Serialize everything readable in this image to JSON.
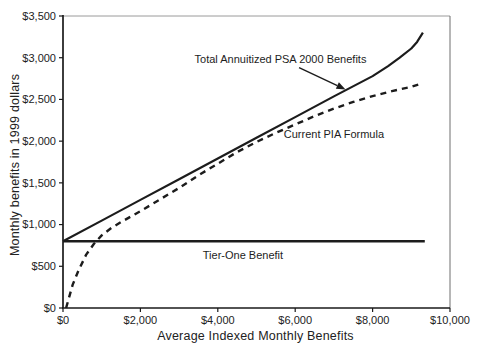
{
  "figure": {
    "background": "#ffffff"
  },
  "chart_data": {
    "type": "line",
    "title": "",
    "xlabel": "Average Indexed Monthly Benefits",
    "ylabel": "Monthly benefits in 1999 dollars",
    "xlim": [
      0,
      10000
    ],
    "ylim": [
      0,
      3500
    ],
    "grid": false,
    "legend_position": "inline-annotations",
    "colors": {
      "axis": "#1a1a1a",
      "frame_top": "#9a9a9a",
      "frame_right": "#6f6f6f",
      "line": "#1c1c1c",
      "text": "#222222"
    },
    "x_ticks": [
      {
        "value": 0,
        "label": "$0"
      },
      {
        "value": 2000,
        "label": "$2,000"
      },
      {
        "value": 4000,
        "label": "$4,000"
      },
      {
        "value": 6000,
        "label": "$6,000"
      },
      {
        "value": 8000,
        "label": "$8,000"
      },
      {
        "value": 10000,
        "label": "$10,000"
      }
    ],
    "y_ticks": [
      {
        "value": 0,
        "label": "$0"
      },
      {
        "value": 500,
        "label": "$500"
      },
      {
        "value": 1000,
        "label": "$1,000"
      },
      {
        "value": 1500,
        "label": "$1,500"
      },
      {
        "value": 2000,
        "label": "$2,000"
      },
      {
        "value": 2500,
        "label": "$2,500"
      },
      {
        "value": 3000,
        "label": "$3,000"
      },
      {
        "value": 3500,
        "label": "$3,500"
      }
    ],
    "series": [
      {
        "name": "Current PIA Formula",
        "style": "dashed",
        "width": 2.4,
        "points": [
          [
            80,
            0
          ],
          [
            250,
            280
          ],
          [
            400,
            450
          ],
          [
            600,
            640
          ],
          [
            800,
            770
          ],
          [
            1000,
            870
          ],
          [
            1250,
            960
          ],
          [
            1500,
            1030
          ],
          [
            2000,
            1160
          ],
          [
            2500,
            1300
          ],
          [
            3000,
            1440
          ],
          [
            3500,
            1590
          ],
          [
            4000,
            1730
          ],
          [
            4500,
            1870
          ],
          [
            5000,
            1990
          ],
          [
            5500,
            2100
          ],
          [
            6000,
            2200
          ],
          [
            6500,
            2300
          ],
          [
            7000,
            2390
          ],
          [
            7500,
            2470
          ],
          [
            8000,
            2540
          ],
          [
            8500,
            2600
          ],
          [
            9000,
            2650
          ],
          [
            9250,
            2690
          ]
        ]
      },
      {
        "name": "Tier-One Benefit",
        "style": "solid",
        "width": 2.4,
        "points": [
          [
            0,
            800
          ],
          [
            9350,
            800
          ]
        ]
      },
      {
        "name": "Total Annuitized PSA 2000 Benefits",
        "style": "solid",
        "width": 2.2,
        "points": [
          [
            0,
            800
          ],
          [
            1000,
            1048
          ],
          [
            2000,
            1296
          ],
          [
            3000,
            1544
          ],
          [
            4000,
            1792
          ],
          [
            5000,
            2040
          ],
          [
            6000,
            2288
          ],
          [
            7000,
            2536
          ],
          [
            8000,
            2780
          ],
          [
            8400,
            2900
          ],
          [
            8700,
            3000
          ],
          [
            9000,
            3110
          ],
          [
            9150,
            3190
          ],
          [
            9300,
            3300
          ]
        ]
      }
    ],
    "annotations": [
      {
        "id": "psa",
        "text": "Total Annuitized PSA 2000 Benefits",
        "x": 5620,
        "y": 2980,
        "arrow": {
          "x1": 6100,
          "y1": 2880,
          "x2": 7300,
          "y2": 2620
        }
      },
      {
        "id": "pia",
        "text": "Current PIA Formula",
        "x": 7000,
        "y": 2090
      },
      {
        "id": "tier",
        "text": "Tier-One Benefit",
        "x": 4650,
        "y": 630
      }
    ]
  }
}
